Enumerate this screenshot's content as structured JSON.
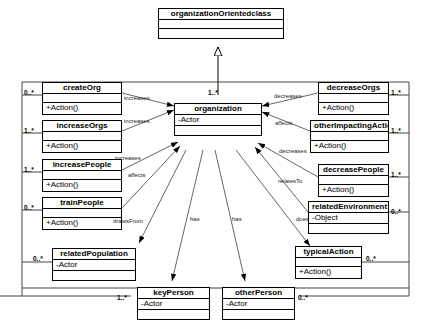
{
  "diagram": {
    "classes": [
      {
        "id": "organizationOrientedclass",
        "name": "organizationOrientedclass",
        "attribute": "",
        "operation": ""
      },
      {
        "id": "createOrg",
        "name": "createOrg",
        "attribute": "",
        "operation": "+Action()"
      },
      {
        "id": "increaseOrgs",
        "name": "increaseOrgs",
        "attribute": "",
        "operation": "+Action()"
      },
      {
        "id": "increasePeople",
        "name": "increasePeople",
        "attribute": "",
        "operation": "+Action()"
      },
      {
        "id": "trainPeople",
        "name": "trainPeople",
        "attribute": "",
        "operation": "+Action()"
      },
      {
        "id": "organization",
        "name": "organization",
        "attribute": "-Actor",
        "operation": ""
      },
      {
        "id": "decreaseOrgs",
        "name": "decreaseOrgs",
        "attribute": "",
        "operation": "+Action()"
      },
      {
        "id": "otherImpactingAction",
        "name": "otherImpactingAction",
        "attribute": "",
        "operation": "+Action()"
      },
      {
        "id": "decreasePeople",
        "name": "decreasePeople",
        "attribute": "",
        "operation": "+Action()"
      },
      {
        "id": "relatedEnvironment",
        "name": "relatedEnvironment",
        "attribute": "-Object",
        "operation": ""
      },
      {
        "id": "typicalAction",
        "name": "typicalAction",
        "attribute": "",
        "operation": "+Action()"
      },
      {
        "id": "relatedPopulation",
        "name": "relatedPopulation",
        "attribute": "-Actor",
        "operation": ""
      },
      {
        "id": "keyPerson",
        "name": "keyPerson",
        "attribute": "-Actor",
        "operation": ""
      },
      {
        "id": "otherPerson",
        "name": "otherPerson",
        "attribute": "-Actor",
        "operation": ""
      }
    ],
    "edge_labels": [
      {
        "id": "increases-createOrg",
        "text": "increases"
      },
      {
        "id": "increases-increaseOrgs",
        "text": "increases"
      },
      {
        "id": "increases-increasePeople",
        "text": "increases"
      },
      {
        "id": "affects-left",
        "text": "affects"
      },
      {
        "id": "drawsFrom",
        "text": "drawsFrom"
      },
      {
        "id": "has-keyPerson",
        "text": "has"
      },
      {
        "id": "has-otherPerson",
        "text": "has"
      },
      {
        "id": "decreases-decreaseOrgs",
        "text": "decreases"
      },
      {
        "id": "affects-right",
        "text": "affects"
      },
      {
        "id": "decreases-decreasePeople",
        "text": "decreases"
      },
      {
        "id": "relatesTo",
        "text": "relatesTo"
      },
      {
        "id": "does",
        "text": "does"
      }
    ],
    "multiplicities": [
      {
        "id": "mult-organization-top",
        "text": "1..*"
      },
      {
        "id": "mult-createOrg",
        "text": "0..*"
      },
      {
        "id": "mult-increaseOrgs",
        "text": "1..*"
      },
      {
        "id": "mult-increasePeople",
        "text": "1..*"
      },
      {
        "id": "mult-trainPeople",
        "text": "0..*"
      },
      {
        "id": "mult-relatedPopulation",
        "text": "0..*"
      },
      {
        "id": "mult-keyPerson",
        "text": "1..*"
      },
      {
        "id": "mult-otherPerson",
        "text": "0..*"
      },
      {
        "id": "mult-decreaseOrgs",
        "text": "1..*"
      },
      {
        "id": "mult-otherImpactingAction",
        "text": "1..*"
      },
      {
        "id": "mult-decreasePeople",
        "text": "1..*"
      },
      {
        "id": "mult-relatedEnvironment",
        "text": "0..*"
      },
      {
        "id": "mult-typicalAction",
        "text": "0..*"
      }
    ]
  }
}
